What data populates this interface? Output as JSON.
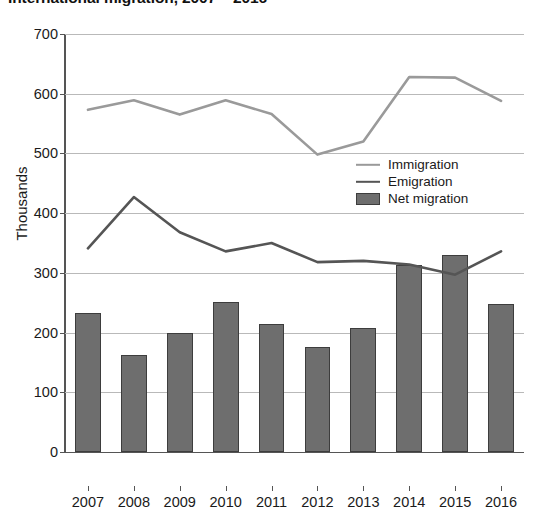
{
  "title": "International migration, 2007 – 2016",
  "axes": {
    "y_title": "Thousands",
    "y_ticks": [
      0,
      100,
      200,
      300,
      400,
      500,
      600,
      700
    ],
    "x_ticks": [
      "2007",
      "2008",
      "2009",
      "2010",
      "2011",
      "2012",
      "2013",
      "2014",
      "2015",
      "2016"
    ]
  },
  "legend": {
    "position": "inside-right",
    "items": [
      {
        "label": "Immigration",
        "type": "line",
        "color": "#9a9a9a",
        "icon": "line-swatch-icon"
      },
      {
        "label": "Emigration",
        "type": "line",
        "color": "#555555",
        "icon": "line-swatch-icon"
      },
      {
        "label": "Net migration",
        "type": "bar",
        "color": "#6e6e6e",
        "icon": "box-swatch-icon"
      }
    ]
  },
  "chart_data": {
    "type": "bar",
    "title": "International migration, 2007 – 2016",
    "xlabel": "",
    "ylabel": "Thousands",
    "ylim": [
      0,
      700
    ],
    "grid": true,
    "legend_position": "inside-right",
    "categories": [
      "2007",
      "2008",
      "2009",
      "2010",
      "2011",
      "2012",
      "2013",
      "2014",
      "2015",
      "2016"
    ],
    "series": [
      {
        "name": "Immigration",
        "type": "line",
        "color": "#9a9a9a",
        "values": [
          573,
          589,
          565,
          589,
          566,
          498,
          520,
          628,
          627,
          588
        ]
      },
      {
        "name": "Emigration",
        "type": "line",
        "color": "#555555",
        "values": [
          341,
          427,
          368,
          336,
          350,
          318,
          320,
          314,
          297,
          336
        ]
      },
      {
        "name": "Net migration",
        "type": "bar",
        "color": "#6e6e6e",
        "values": [
          233,
          163,
          199,
          252,
          215,
          176,
          208,
          313,
          330,
          248
        ]
      }
    ]
  }
}
